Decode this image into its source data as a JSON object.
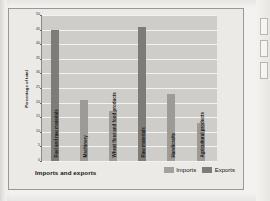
{
  "chart_data": {
    "type": "bar",
    "title": "",
    "xlabel": "Imports and exports",
    "ylabel": "Percentage of total",
    "ylim": [
      0,
      50
    ],
    "yticks": [
      0,
      5,
      10,
      15,
      20,
      25,
      30,
      35,
      40,
      45,
      50
    ],
    "grid": true,
    "legend_position": "bottom-right",
    "categories": [
      "Fuel and raw materials",
      "Machinery",
      "Wheat flour and food products",
      "Raw materials",
      "Handicrafts",
      "Agricultural products"
    ],
    "series": [
      {
        "name": "Imports",
        "color": "#9d9b97",
        "values": [
          45,
          21,
          17,
          46,
          23,
          13
        ]
      }
    ],
    "values": [
      45,
      21,
      17,
      46,
      23,
      13
    ],
    "bar_roles": [
      "Exports",
      "Imports",
      "Imports",
      "Exports",
      "Imports",
      "Imports"
    ]
  },
  "axes": {
    "y_title": "Percentage of total",
    "x_title": "Imports and exports",
    "y_tick_labels": [
      "50",
      "45",
      "40",
      "35",
      "30",
      "25",
      "20",
      "15",
      "10",
      "5",
      "0"
    ]
  },
  "legend": {
    "items": [
      {
        "label": "Imports",
        "color": "#a3a19d"
      },
      {
        "label": "Exports",
        "color": "#7e7c78"
      }
    ]
  },
  "category_labels": [
    "Fuel and raw materials",
    "Machinery",
    "Wheat flour and food products",
    "Raw materials",
    "Handicrafts",
    "Agricultural products"
  ]
}
